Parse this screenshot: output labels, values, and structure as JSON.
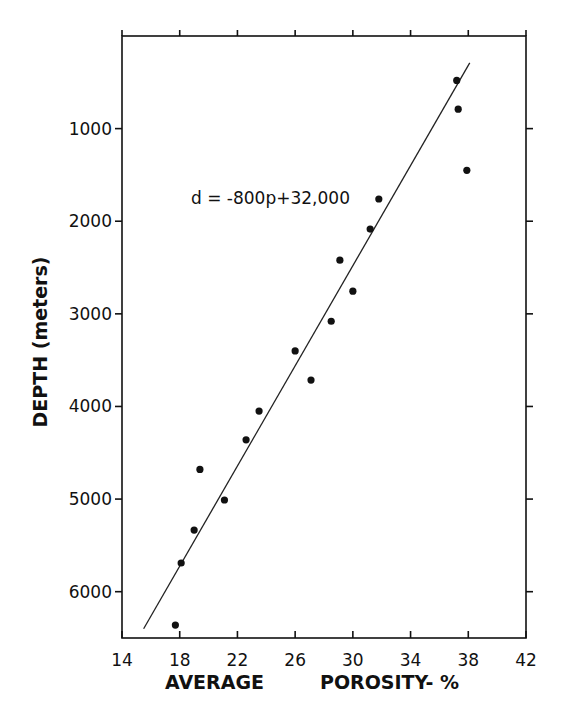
{
  "chart_data": {
    "type": "scatter",
    "title": "",
    "xlabel_parts": [
      "AVERAGE",
      "POROSITY- %"
    ],
    "xlabel": "AVERAGE POROSITY- %",
    "ylabel": "DEPTH (meters)",
    "xlim": [
      14,
      42
    ],
    "ylim": [
      6500,
      0
    ],
    "y_inverted": true,
    "grid": false,
    "x_ticks": [
      14,
      18,
      22,
      26,
      30,
      34,
      38,
      42
    ],
    "y_ticks": [
      1000,
      2000,
      3000,
      4000,
      5000,
      6000
    ],
    "series": [
      {
        "name": "observations",
        "marker": "filled-circle",
        "points": [
          {
            "x": 37.2,
            "y": 480
          },
          {
            "x": 37.3,
            "y": 790
          },
          {
            "x": 37.9,
            "y": 1450
          },
          {
            "x": 31.8,
            "y": 1760
          },
          {
            "x": 31.2,
            "y": 2085
          },
          {
            "x": 29.1,
            "y": 2420
          },
          {
            "x": 30.0,
            "y": 2755
          },
          {
            "x": 28.5,
            "y": 3080
          },
          {
            "x": 26.0,
            "y": 3400
          },
          {
            "x": 27.1,
            "y": 3715
          },
          {
            "x": 23.5,
            "y": 4050
          },
          {
            "x": 22.6,
            "y": 4360
          },
          {
            "x": 19.4,
            "y": 4680
          },
          {
            "x": 21.1,
            "y": 5010
          },
          {
            "x": 19.0,
            "y": 5335
          },
          {
            "x": 18.1,
            "y": 5690
          },
          {
            "x": 17.7,
            "y": 6360
          }
        ]
      },
      {
        "name": "fit line",
        "type": "line",
        "points": [
          {
            "x": 15.5,
            "y": 6400
          },
          {
            "x": 38.1,
            "y": 290
          }
        ]
      }
    ],
    "annotations": [
      {
        "text": "d = -800p+32,000",
        "x": 25.0,
        "y": 1760
      }
    ]
  }
}
